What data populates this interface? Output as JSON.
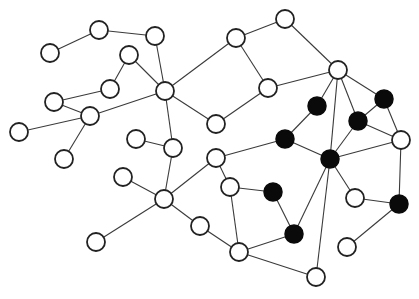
{
  "diagram": {
    "type": "network-graph",
    "node_radius": 9,
    "colors": {
      "background": "#ffffff",
      "edge": "#3a3a3a",
      "white_node_fill": "#ffffff",
      "black_node_fill": "#0a0a0a",
      "stroke": "#222222"
    },
    "nodes": [
      {
        "id": "A",
        "x": 99,
        "y": 30,
        "color": "white"
      },
      {
        "id": "B",
        "x": 155,
        "y": 36,
        "color": "white"
      },
      {
        "id": "C",
        "x": 50,
        "y": 53,
        "color": "white"
      },
      {
        "id": "D",
        "x": 129,
        "y": 55,
        "color": "white"
      },
      {
        "id": "E",
        "x": 110,
        "y": 89,
        "color": "white"
      },
      {
        "id": "F",
        "x": 165,
        "y": 91,
        "color": "white"
      },
      {
        "id": "G",
        "x": 236,
        "y": 38,
        "color": "white"
      },
      {
        "id": "H",
        "x": 285,
        "y": 19,
        "color": "white"
      },
      {
        "id": "I",
        "x": 338,
        "y": 70,
        "color": "white"
      },
      {
        "id": "J",
        "x": 268,
        "y": 88,
        "color": "white"
      },
      {
        "id": "K",
        "x": 54,
        "y": 102,
        "color": "white"
      },
      {
        "id": "L",
        "x": 90,
        "y": 116,
        "color": "white"
      },
      {
        "id": "M",
        "x": 19,
        "y": 132,
        "color": "white"
      },
      {
        "id": "N",
        "x": 216,
        "y": 124,
        "color": "white"
      },
      {
        "id": "O",
        "x": 64,
        "y": 159,
        "color": "white"
      },
      {
        "id": "P",
        "x": 136,
        "y": 139,
        "color": "white"
      },
      {
        "id": "Q",
        "x": 173,
        "y": 148,
        "color": "white"
      },
      {
        "id": "R",
        "x": 216,
        "y": 158,
        "color": "white"
      },
      {
        "id": "S",
        "x": 123,
        "y": 177,
        "color": "white"
      },
      {
        "id": "T",
        "x": 164,
        "y": 199,
        "color": "white"
      },
      {
        "id": "U",
        "x": 230,
        "y": 187,
        "color": "white"
      },
      {
        "id": "V",
        "x": 200,
        "y": 226,
        "color": "white"
      },
      {
        "id": "W",
        "x": 96,
        "y": 242,
        "color": "white"
      },
      {
        "id": "X",
        "x": 239,
        "y": 252,
        "color": "white"
      },
      {
        "id": "Y",
        "x": 316,
        "y": 277,
        "color": "white"
      },
      {
        "id": "Z",
        "x": 355,
        "y": 198,
        "color": "white"
      },
      {
        "id": "AA",
        "x": 347,
        "y": 247,
        "color": "white"
      },
      {
        "id": "AB",
        "x": 401,
        "y": 140,
        "color": "white"
      },
      {
        "id": "b1",
        "x": 317,
        "y": 106,
        "color": "black"
      },
      {
        "id": "b2",
        "x": 384,
        "y": 99,
        "color": "black"
      },
      {
        "id": "b3",
        "x": 358,
        "y": 121,
        "color": "black"
      },
      {
        "id": "b4",
        "x": 285,
        "y": 139,
        "color": "black"
      },
      {
        "id": "b5",
        "x": 330,
        "y": 159,
        "color": "black"
      },
      {
        "id": "b6",
        "x": 273,
        "y": 192,
        "color": "black"
      },
      {
        "id": "b7",
        "x": 294,
        "y": 234,
        "color": "black"
      },
      {
        "id": "b8",
        "x": 399,
        "y": 204,
        "color": "black"
      }
    ],
    "edges": [
      [
        "C",
        "A"
      ],
      [
        "A",
        "B"
      ],
      [
        "B",
        "F"
      ],
      [
        "D",
        "F"
      ],
      [
        "D",
        "E"
      ],
      [
        "E",
        "K"
      ],
      [
        "K",
        "L"
      ],
      [
        "L",
        "M"
      ],
      [
        "L",
        "F"
      ],
      [
        "L",
        "O"
      ],
      [
        "F",
        "G"
      ],
      [
        "F",
        "N"
      ],
      [
        "F",
        "Q"
      ],
      [
        "G",
        "H"
      ],
      [
        "G",
        "J"
      ],
      [
        "H",
        "I"
      ],
      [
        "J",
        "I"
      ],
      [
        "J",
        "N"
      ],
      [
        "P",
        "Q"
      ],
      [
        "Q",
        "T"
      ],
      [
        "S",
        "T"
      ],
      [
        "T",
        "W"
      ],
      [
        "T",
        "R"
      ],
      [
        "T",
        "V"
      ],
      [
        "R",
        "U"
      ],
      [
        "R",
        "b4"
      ],
      [
        "U",
        "b6"
      ],
      [
        "U",
        "X"
      ],
      [
        "V",
        "X"
      ],
      [
        "X",
        "b7"
      ],
      [
        "X",
        "Y"
      ],
      [
        "b6",
        "b7"
      ],
      [
        "b7",
        "b5"
      ],
      [
        "b5",
        "b4"
      ],
      [
        "b5",
        "b3"
      ],
      [
        "b5",
        "AB"
      ],
      [
        "b5",
        "I"
      ],
      [
        "b5",
        "Y"
      ],
      [
        "b5",
        "Z"
      ],
      [
        "I",
        "b1"
      ],
      [
        "I",
        "b3"
      ],
      [
        "I",
        "b2"
      ],
      [
        "b1",
        "b4"
      ],
      [
        "b2",
        "b3"
      ],
      [
        "b2",
        "AB"
      ],
      [
        "b3",
        "AB"
      ],
      [
        "AB",
        "b8"
      ],
      [
        "Z",
        "b8"
      ],
      [
        "AA",
        "b8"
      ]
    ]
  }
}
